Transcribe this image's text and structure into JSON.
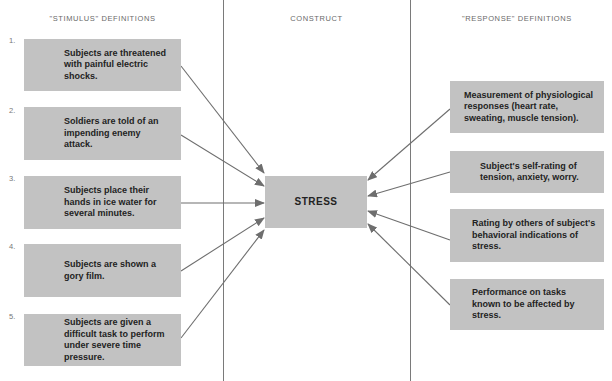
{
  "headers": {
    "stimulus": "\"STIMULUS\" DEFINITIONS",
    "construct": "CONSTRUCT",
    "response": "\"RESPONSE\" DEFINITIONS"
  },
  "stimulus_items": [
    {
      "number": "1.",
      "text": "Subjects are threatened with painful electric shocks."
    },
    {
      "number": "2.",
      "text": "Soldiers are told of an impending enemy attack."
    },
    {
      "number": "3.",
      "text": "Subjects place their hands in ice water for several minutes."
    },
    {
      "number": "4.",
      "text": "Subjects are shown a gory film."
    },
    {
      "number": "5.",
      "text": "Subjects are given a difficult task to perform under severe time pressure."
    }
  ],
  "construct": {
    "label": "STRESS"
  },
  "response_items": [
    {
      "text": "Measurement of physiological responses (heart rate, sweating, muscle tension)."
    },
    {
      "text": "Subject's self-rating of tension, anxiety, worry."
    },
    {
      "text": "Rating by others of subject's behavioral indications of stress."
    },
    {
      "text": "Performance on tasks known to be affected by stress."
    }
  ],
  "colors": {
    "box_fill": "#c2c2c2",
    "arrow": "#6e6e6e",
    "divider": "#7a7a7a"
  }
}
